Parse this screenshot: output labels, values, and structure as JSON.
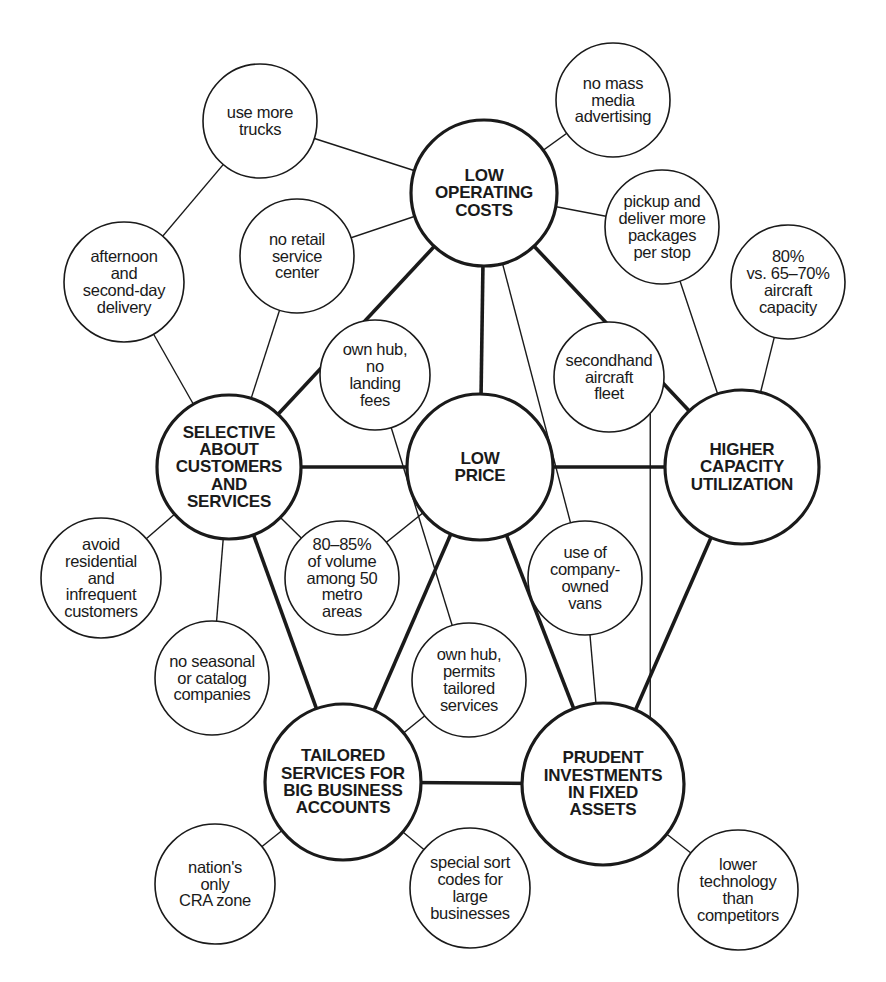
{
  "diagram": {
    "title": "",
    "colors": {
      "ink": "#1a1a1a",
      "background": "#ffffff"
    },
    "nodes": [
      {
        "id": "use_trucks",
        "label": "use more\ntrucks",
        "type": "minor",
        "cx": 260,
        "cy": 121,
        "r": 57
      },
      {
        "id": "mass_media",
        "label": "no mass\nmedia\nadvertising",
        "type": "minor",
        "cx": 613,
        "cy": 100,
        "r": 57
      },
      {
        "id": "low_operating_costs",
        "label": "LOW\nOPERATING\nCOSTS",
        "type": "major",
        "cx": 484,
        "cy": 193,
        "r": 73
      },
      {
        "id": "no_retail",
        "label": "no retail\nservice\ncenter",
        "type": "minor",
        "cx": 297,
        "cy": 256,
        "r": 57
      },
      {
        "id": "pickup",
        "label": "pickup and\ndeliver more\npackages\nper stop",
        "type": "minor",
        "cx": 662,
        "cy": 227,
        "r": 57
      },
      {
        "id": "afternoon",
        "label": "afternoon\nand\nsecond-day\ndelivery",
        "type": "minor",
        "cx": 124,
        "cy": 282,
        "r": 60
      },
      {
        "id": "aircraft_capacity",
        "label": "80%\nvs. 65–70%\naircraft\ncapacity",
        "type": "minor",
        "cx": 788,
        "cy": 282,
        "r": 57
      },
      {
        "id": "own_hub_landing",
        "label": "own hub,\nno\nlanding\nfees",
        "type": "minor",
        "cx": 375,
        "cy": 375,
        "r": 55
      },
      {
        "id": "secondhand",
        "label": "secondhand\naircraft\nfleet",
        "type": "minor",
        "cx": 609,
        "cy": 377,
        "r": 55
      },
      {
        "id": "selective",
        "label": "SELECTIVE\nABOUT\nCUSTOMERS\nAND\nSERVICES",
        "type": "major",
        "cx": 229,
        "cy": 467,
        "r": 72
      },
      {
        "id": "low_price",
        "label": "LOW\nPRICE",
        "type": "major",
        "cx": 480,
        "cy": 467,
        "r": 73
      },
      {
        "id": "higher_capacity",
        "label": "HIGHER\nCAPACITY\nUTILIZATION",
        "type": "major",
        "cx": 742,
        "cy": 467,
        "r": 77
      },
      {
        "id": "avoid_residential",
        "label": "avoid\nresidential\nand\ninfrequent\ncustomers",
        "type": "minor",
        "cx": 101,
        "cy": 578,
        "r": 60
      },
      {
        "id": "volume_metro",
        "label": "80–85%\nof volume\namong 50\nmetro\nareas",
        "type": "minor",
        "cx": 342,
        "cy": 578,
        "r": 57
      },
      {
        "id": "company_vans",
        "label": "use of\ncompany-\nowned\nvans",
        "type": "minor",
        "cx": 585,
        "cy": 578,
        "r": 57
      },
      {
        "id": "no_seasonal",
        "label": "no seasonal\nor catalog\ncompanies",
        "type": "minor",
        "cx": 212,
        "cy": 678,
        "r": 57
      },
      {
        "id": "own_hub_tailored",
        "label": "own hub,\npermits\ntailored\nservices",
        "type": "minor",
        "cx": 469,
        "cy": 680,
        "r": 57
      },
      {
        "id": "tailored_services",
        "label": "TAILORED\nSERVICES FOR\nBIG BUSINESS\nACCOUNTS",
        "type": "major",
        "cx": 343,
        "cy": 782,
        "r": 78
      },
      {
        "id": "prudent_investments",
        "label": "PRUDENT\nINVESTMENTS\nIN FIXED\nASSETS",
        "type": "major",
        "cx": 603,
        "cy": 784,
        "r": 81
      },
      {
        "id": "cra_zone",
        "label": "nation's\nonly\nCRA zone",
        "type": "minor",
        "cx": 215,
        "cy": 884,
        "r": 60
      },
      {
        "id": "special_sort",
        "label": "special sort\ncodes for\nlarge\nbusinesses",
        "type": "minor",
        "cx": 470,
        "cy": 888,
        "r": 60
      },
      {
        "id": "lower_tech",
        "label": "lower\ntechnology\nthan\ncompetitors",
        "type": "minor",
        "cx": 738,
        "cy": 890,
        "r": 60
      }
    ],
    "edges": [
      {
        "from": "low_operating_costs",
        "to": "selective",
        "weight": "thick"
      },
      {
        "from": "low_operating_costs",
        "to": "low_price",
        "weight": "thick"
      },
      {
        "from": "low_operating_costs",
        "to": "higher_capacity",
        "weight": "thick"
      },
      {
        "from": "selective",
        "to": "low_price",
        "weight": "thick"
      },
      {
        "from": "low_price",
        "to": "higher_capacity",
        "weight": "thick"
      },
      {
        "from": "selective",
        "to": "tailored_services",
        "weight": "thick"
      },
      {
        "from": "low_price",
        "to": "tailored_services",
        "weight": "thick"
      },
      {
        "from": "low_price",
        "to": "prudent_investments",
        "weight": "thick"
      },
      {
        "from": "higher_capacity",
        "to": "prudent_investments",
        "weight": "thick"
      },
      {
        "from": "tailored_services",
        "to": "prudent_investments",
        "weight": "thick"
      },
      {
        "from": "use_trucks",
        "to": "low_operating_costs",
        "weight": "thin"
      },
      {
        "from": "use_trucks",
        "to": "afternoon",
        "weight": "thin"
      },
      {
        "from": "mass_media",
        "to": "low_operating_costs",
        "weight": "thin"
      },
      {
        "from": "no_retail",
        "to": "low_operating_costs",
        "weight": "thin"
      },
      {
        "from": "no_retail",
        "to": "selective",
        "weight": "thin"
      },
      {
        "from": "pickup",
        "to": "low_operating_costs",
        "weight": "thin"
      },
      {
        "from": "pickup",
        "to": "higher_capacity",
        "weight": "thin"
      },
      {
        "from": "aircraft_capacity",
        "to": "higher_capacity",
        "weight": "thin"
      },
      {
        "from": "afternoon",
        "to": "selective",
        "weight": "thin"
      },
      {
        "from": "low_operating_costs",
        "to": "company_vans",
        "weight": "thin"
      },
      {
        "from": "own_hub_landing",
        "to": "own_hub_tailored",
        "weight": "thin"
      },
      {
        "from": "secondhand",
        "to": "prudent_investments",
        "weight": "thin",
        "vertical": true
      },
      {
        "from": "avoid_residential",
        "to": "selective",
        "weight": "thin"
      },
      {
        "from": "volume_metro",
        "to": "selective",
        "weight": "thin"
      },
      {
        "from": "volume_metro",
        "to": "low_price",
        "weight": "thin"
      },
      {
        "from": "company_vans",
        "to": "prudent_investments",
        "weight": "thin"
      },
      {
        "from": "no_seasonal",
        "to": "selective",
        "weight": "thin"
      },
      {
        "from": "own_hub_tailored",
        "to": "tailored_services",
        "weight": "thin"
      },
      {
        "from": "cra_zone",
        "to": "tailored_services",
        "weight": "thin"
      },
      {
        "from": "special_sort",
        "to": "tailored_services",
        "weight": "thin"
      },
      {
        "from": "lower_tech",
        "to": "prudent_investments",
        "weight": "thin"
      }
    ]
  }
}
